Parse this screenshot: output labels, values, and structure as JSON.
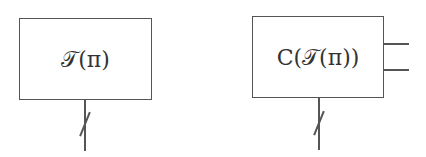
{
  "diagram": {
    "blocks": [
      {
        "id": "block-1",
        "label": "𝒯(π)",
        "inputs": {
          "bottom_wire": "bundled (slash)"
        },
        "outputs": []
      },
      {
        "id": "block-2",
        "label": "C(𝒯(π))",
        "inputs": {
          "bottom_wire": "bundled (slash)"
        },
        "outputs": [
          "output-1",
          "output-2"
        ]
      }
    ],
    "colors": {
      "stroke": "#555555",
      "text": "#333333",
      "background": "#ffffff"
    }
  }
}
